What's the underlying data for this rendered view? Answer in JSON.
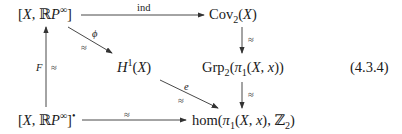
{
  "diagram": {
    "equation_number": "(4.3.4)",
    "nodes": {
      "top_left": {
        "open": "[",
        "X": "X",
        "sep": ", ",
        "RP": "ℝ",
        "P": "P",
        "sup": "∞",
        "close": "]"
      },
      "top_right": {
        "name": "Cov",
        "sub": "2",
        "arg_open": "(",
        "X": "X",
        "arg_close": ")"
      },
      "middle_left": {
        "H": "H",
        "sup": "1",
        "arg_open": "(",
        "X": "X",
        "arg_close": ")"
      },
      "middle_right": {
        "name": "Grp",
        "sub": "2",
        "open": "(",
        "pi": "π",
        "pisub": "1",
        "inner": "(",
        "X": "X",
        "comma": ", ",
        "x": "x",
        "close": "))"
      },
      "bottom_left": {
        "open": "[",
        "X": "X",
        "sep": ", ",
        "RP": "ℝ",
        "P": "P",
        "sup": "∞",
        "close": "]",
        "bullet": "•"
      },
      "bottom_right": {
        "name": "hom(",
        "pi": "π",
        "pisub": "1",
        "inner": "(",
        "X": "X",
        "comma": ", ",
        "x": "x",
        "mid": "), ",
        "Z": "ℤ",
        "zsub": "2",
        "close": ")"
      }
    },
    "arrows": {
      "top_horizontal": {
        "label": "ind"
      },
      "diag_upper": {
        "label_top": "ϕ",
        "label_bottom": "≈"
      },
      "diag_lower": {
        "label_top": "e",
        "label_bottom": "≈"
      },
      "left_vertical": {
        "label_left": "F",
        "label_right": "≈"
      },
      "right_upper_vertical": {
        "label": "≈"
      },
      "right_lower_vertical": {
        "label": "≈"
      },
      "bottom_horizontal": {
        "label": "≈"
      }
    }
  }
}
